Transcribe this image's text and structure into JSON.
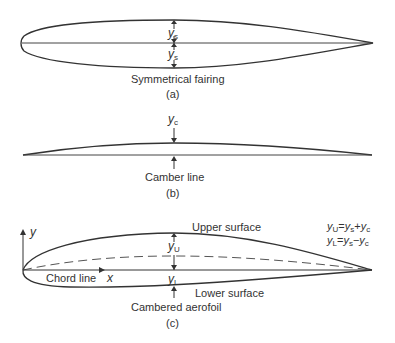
{
  "figure": {
    "panels": [
      {
        "id": "a",
        "caption": "Symmetrical fairing",
        "tag": "(a)",
        "labels": {
          "upper_thickness": {
            "var": "y",
            "sub": "s"
          },
          "lower_thickness": {
            "var": "y",
            "sub": "s"
          }
        }
      },
      {
        "id": "b",
        "caption": "Camber line",
        "tag": "(b)",
        "labels": {
          "camber": {
            "var": "y",
            "sub": "c"
          }
        }
      },
      {
        "id": "c",
        "caption": "Cambered aerofoil",
        "tag": "(c)",
        "labels": {
          "upper_surface": "Upper surface",
          "lower_surface": "Lower surface",
          "chord_line": "Chord line",
          "x_axis": "x",
          "y_axis": "y",
          "upper_ordinate": {
            "var": "y",
            "sub": "U"
          },
          "lower_ordinate": {
            "var": "y",
            "sub": "L"
          }
        },
        "equations": [
          {
            "lhs_var": "y",
            "lhs_sub": "U",
            "rhs": [
              {
                "var": "y",
                "sub": "s"
              },
              {
                "op": "+"
              },
              {
                "var": "y",
                "sub": "c"
              }
            ]
          },
          {
            "lhs_var": "y",
            "lhs_sub": "L",
            "rhs": [
              {
                "var": "y",
                "sub": "s"
              },
              {
                "op": "−"
              },
              {
                "var": "y",
                "sub": "c"
              }
            ]
          }
        ]
      }
    ],
    "colors": {
      "stroke": "#333333",
      "text": "#333333",
      "dashed": "#555555"
    }
  }
}
